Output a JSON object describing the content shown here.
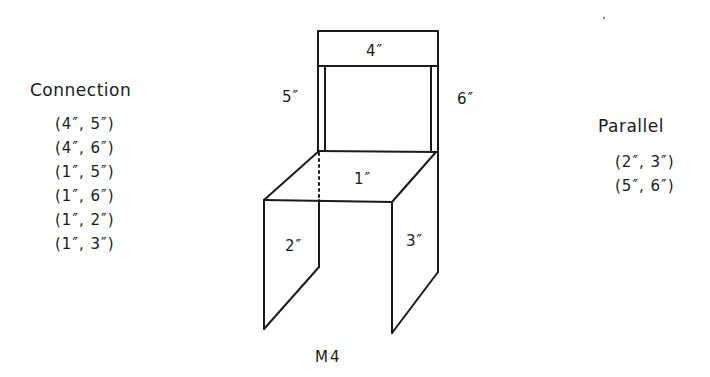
{
  "diagram": {
    "caption": "M4",
    "parts": {
      "seat": "1″",
      "left_leg": "2″",
      "right_leg": "3″",
      "top_rail": "4″",
      "left_post": "5″",
      "right_post": "6″"
    }
  },
  "connection": {
    "heading": "Connection",
    "pairs": [
      "(4″, 5″)",
      "(4″, 6″)",
      "(1″, 5″)",
      "(1″, 6″)",
      "(1″, 2″)",
      "(1″, 3″)"
    ]
  },
  "parallel": {
    "heading": "Parallel",
    "pairs": [
      "(2″, 3″)",
      "(5″, 6″)"
    ]
  },
  "colors": {
    "ink": "#1a1a1a",
    "background": "#ffffff"
  }
}
